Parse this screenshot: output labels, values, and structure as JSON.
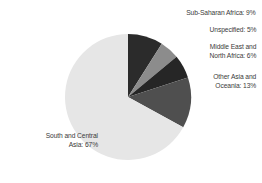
{
  "chart_data": {
    "type": "pie",
    "title": "",
    "subtitle": "",
    "xlabel": "",
    "ylabel": "",
    "legend_position": "none",
    "grid": false,
    "units": "percent",
    "start_angle_deg": 0,
    "direction": "clockwise",
    "categories": [
      "Sub-Saharan Africa",
      "Unspecified",
      "Middle East and North Africa",
      "Other Asia and Oceania",
      "South and Central Asia"
    ],
    "values": [
      9,
      5,
      6,
      13,
      67
    ],
    "slices": [
      {
        "name": "Sub-Saharan Africa",
        "value": 9,
        "value_text": "9%",
        "label_text": "Sub-Saharan Africa: 9%",
        "color": "#2b2b2b"
      },
      {
        "name": "Unspecified",
        "value": 5,
        "value_text": "5%",
        "label_text": "Unspecified: 5%",
        "color": "#8c8c8c"
      },
      {
        "name": "Middle East and North Africa",
        "value": 6,
        "value_text": "6%",
        "label_text": "Middle East and\nNorth Africa: 6%",
        "color": "#262626"
      },
      {
        "name": "Other Asia and Oceania",
        "value": 13,
        "value_text": "13%",
        "label_text": "Other Asia and\nOceania: 13%",
        "color": "#4f4f4f"
      },
      {
        "name": "South and Central Asia",
        "value": 67,
        "value_text": "67%",
        "label_text": "South and Central\nAsia: 67%",
        "color": "#e6e6e6"
      }
    ]
  },
  "labels": {
    "sub_saharan_africa": "Sub-Saharan Africa: 9%",
    "unspecified": "Unspecified: 5%",
    "middle_east_north_africa": "Middle East and\nNorth Africa: 6%",
    "other_asia_oceania": "Other Asia and\nOceania: 13%",
    "south_central_asia": "South and Central\nAsia: 67%"
  },
  "colors": {
    "background": "#ffffff",
    "text": "#3a3a3a",
    "slice_sub_saharan_africa": "#2b2b2b",
    "slice_unspecified": "#8c8c8c",
    "slice_middle_east_north_africa": "#262626",
    "slice_other_asia_oceania": "#4f4f4f",
    "slice_south_central_asia": "#e6e6e6"
  },
  "geometry": {
    "center_x": 128,
    "center_y": 97,
    "radius": 63
  }
}
